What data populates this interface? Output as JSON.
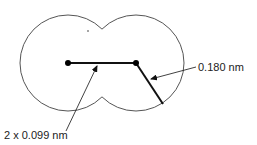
{
  "diagram": {
    "type": "molecule-cross-section",
    "atoms": [
      {
        "name": "atom-left",
        "cx": 68,
        "cy": 63,
        "r": 48
      },
      {
        "name": "atom-right",
        "cx": 136,
        "cy": 63,
        "r": 48
      }
    ],
    "bond": {
      "x1": 68,
      "y1": 63,
      "x2": 136,
      "y2": 63
    },
    "radius_line": {
      "x1": 136,
      "y1": 63,
      "x2": 163,
      "y2": 104
    },
    "labels": {
      "bond_length": "2 x 0.099 nm",
      "vdw_radius": "0.180 nm"
    },
    "colors": {
      "outline": "#555555",
      "line": "#111111",
      "text": "#222222",
      "background": "#ffffff"
    }
  }
}
